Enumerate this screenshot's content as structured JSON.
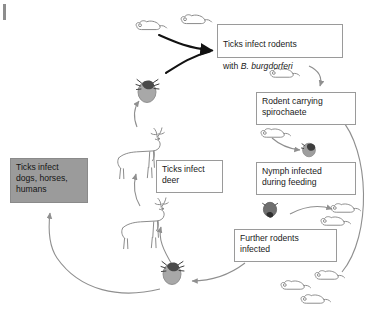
{
  "diagram": {
    "boxes": [
      {
        "id": "ticks-infect-rodents",
        "line1": "Ticks infect rodents",
        "line2_prefix": "with ",
        "line2_species": "B. burgdorferi",
        "shaded": false
      },
      {
        "id": "rodent-carrying-spirochaete",
        "text": "Rodent carrying\nspirochaete",
        "shaded": false
      },
      {
        "id": "nymph-infected",
        "text": "Nymph infected\nduring feeding",
        "shaded": false
      },
      {
        "id": "further-rodents-infected",
        "text": "Further rodents\ninfected",
        "shaded": false
      },
      {
        "id": "ticks-infect-deer",
        "text": "Ticks infect\ndeer",
        "shaded": false
      },
      {
        "id": "ticks-infect-hosts",
        "text": "Ticks infect\ndogs, horses,\nhumans",
        "shaded": true
      }
    ],
    "figures": [
      {
        "id": "mouse-top-left",
        "kind": "mouse-outline"
      },
      {
        "id": "mouse-top-right",
        "kind": "mouse-outline"
      },
      {
        "id": "tick-adult-upper",
        "kind": "tick-engorged"
      },
      {
        "id": "deer-upper",
        "kind": "deer-outline"
      },
      {
        "id": "deer-lower",
        "kind": "deer-outline"
      },
      {
        "id": "tick-adult-lower",
        "kind": "tick-engorged"
      },
      {
        "id": "mouse-right-upper",
        "kind": "mouse-outline"
      },
      {
        "id": "mouse-right-middle",
        "kind": "mouse-outline"
      },
      {
        "id": "nymph-tick-feeding",
        "kind": "nymph-dark"
      },
      {
        "id": "nymph-tick-engorged",
        "kind": "nymph-dark"
      },
      {
        "id": "mouse-mid-right-upper",
        "kind": "mouse-outline"
      },
      {
        "id": "mouse-mid-right-lower",
        "kind": "mouse-outline"
      },
      {
        "id": "mouse-bottom-left",
        "kind": "mouse-outline"
      },
      {
        "id": "mouse-bottom-middle",
        "kind": "mouse-outline"
      },
      {
        "id": "mouse-bottom-right",
        "kind": "mouse-outline"
      }
    ],
    "colors": {
      "arrow": "#8f8f8f",
      "arrow_bold": "#121212",
      "box_border": "#9a9a9a",
      "shaded_fill": "#9b9b9b",
      "tick_body": "#a9a9a9",
      "tick_head": "#4a4a4a",
      "outline": "#8a8a8a"
    }
  }
}
